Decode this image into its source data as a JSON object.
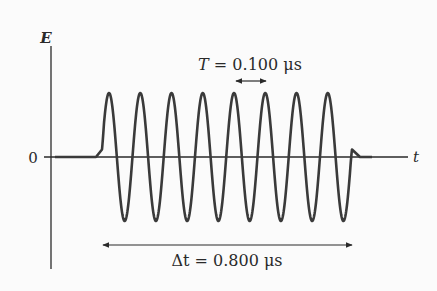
{
  "diagram": {
    "type": "wave-pulse",
    "axes": {
      "y_label": "E",
      "x_label": "t",
      "origin_label": "0"
    },
    "annotations": {
      "period": {
        "symbol": "T",
        "equals": " = ",
        "value": "0.100",
        "unit": " μs",
        "full_text": "T = 0.100 μs"
      },
      "duration": {
        "symbol": "Δt",
        "equals": " = ",
        "value": "0.800",
        "unit": " μs",
        "full_text": "Δt = 0.800 μs"
      }
    },
    "wave": {
      "cycles": 8,
      "period_us": 0.1,
      "duration_us": 0.8,
      "color": "#3a3a3a"
    },
    "colors": {
      "background": "#fbfbfb",
      "axis": "#2a2a2a",
      "wave": "#3a3a3a"
    }
  }
}
